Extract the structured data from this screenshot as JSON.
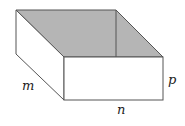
{
  "diagram": {
    "type": "open-box",
    "labels": {
      "depth": "m",
      "width": "n",
      "height": "p"
    },
    "colors": {
      "interior_fill": "#b5b5b5",
      "face_fill": "#ffffff",
      "stroke": "#444444"
    }
  }
}
